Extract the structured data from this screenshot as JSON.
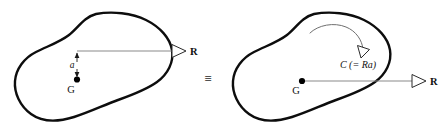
{
  "figure": {
    "equivalence_symbol": "≡",
    "left_diagram": {
      "name": "eccentric-force-diagram",
      "body_label": "rigid-body-outline",
      "force_label": "R",
      "centroid_label": "G",
      "dimension_label": "a",
      "description": "Force R applied along a line of action offset a distance a above the center of gravity G"
    },
    "right_diagram": {
      "name": "force-couple-diagram",
      "body_label": "rigid-body-outline",
      "force_label": "R",
      "centroid_label": "G",
      "moment_label": "C (= Ra)",
      "description": "Equivalent system: force R acting through G plus a couple C equal to R times a"
    },
    "colors": {
      "body_outline": "#0d0d0d",
      "force_line": "#8a8a8a",
      "moment_arc": "#6f6f6f",
      "dimension_line": "#1a1a1a",
      "label_text": "#111111",
      "background": "#ffffff"
    }
  }
}
